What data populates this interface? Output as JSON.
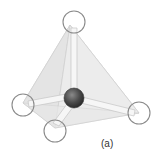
{
  "figure": {
    "label": "(a)",
    "colors": {
      "face_fill": "#e6e6e6",
      "face_edge": "#d0d0d0",
      "bond": "#f4f4f4",
      "bond_edge": "#c8c8c8",
      "outer_atom_stroke": "#8a8a8a",
      "central_atom": "#4a4a4a"
    },
    "central_atom": {
      "cx": 74,
      "cy": 98,
      "r": 10
    },
    "outer_atoms": [
      {
        "name": "top",
        "cx": 74,
        "cy": 22,
        "r": 11
      },
      {
        "name": "left",
        "cx": 23,
        "cy": 105,
        "r": 11
      },
      {
        "name": "bottom",
        "cx": 55,
        "cy": 131,
        "r": 11
      },
      {
        "name": "right",
        "cx": 139,
        "cy": 113,
        "r": 11
      }
    ]
  }
}
